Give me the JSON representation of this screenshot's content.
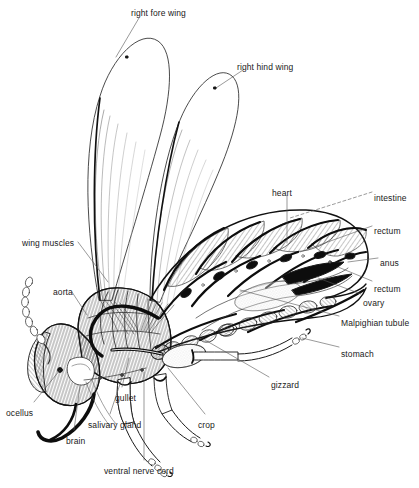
{
  "figure": {
    "type": "scientific line illustration",
    "width": 419,
    "height": 488,
    "background_color": "#ffffff",
    "ink_color": "#1a1a1a"
  },
  "labels": [
    {
      "id": "right-fore-wing",
      "text": "right fore wing",
      "x": 131,
      "y": 8,
      "anchor": "start"
    },
    {
      "id": "right-hind-wing",
      "text": "right hind wing",
      "x": 237,
      "y": 62,
      "anchor": "start"
    },
    {
      "id": "heart",
      "text": "heart",
      "x": 272,
      "y": 188,
      "anchor": "start"
    },
    {
      "id": "intestine",
      "text": "intestine",
      "x": 374,
      "y": 193,
      "anchor": "start"
    },
    {
      "id": "rectum-upper",
      "text": "rectum",
      "x": 374,
      "y": 226,
      "anchor": "start"
    },
    {
      "id": "anus",
      "text": "anus",
      "x": 380,
      "y": 258,
      "anchor": "start"
    },
    {
      "id": "rectum-lower",
      "text": "rectum",
      "x": 374,
      "y": 284,
      "anchor": "start"
    },
    {
      "id": "ovary",
      "text": "ovary",
      "x": 363,
      "y": 298,
      "anchor": "start"
    },
    {
      "id": "malpighian-tubule",
      "text": "Malpighian tubule",
      "x": 341,
      "y": 318,
      "anchor": "start"
    },
    {
      "id": "stomach",
      "text": "stomach",
      "x": 341,
      "y": 349,
      "anchor": "start"
    },
    {
      "id": "gizzard",
      "text": "gizzard",
      "x": 271,
      "y": 380,
      "anchor": "start"
    },
    {
      "id": "crop",
      "text": "crop",
      "x": 198,
      "y": 420,
      "anchor": "start"
    },
    {
      "id": "wing-muscles",
      "text": "wing muscles",
      "x": 22,
      "y": 238,
      "anchor": "start"
    },
    {
      "id": "aorta",
      "text": "aorta",
      "x": 53,
      "y": 287,
      "anchor": "start"
    },
    {
      "id": "ocellus",
      "text": "ocellus",
      "x": 6,
      "y": 408,
      "anchor": "start"
    },
    {
      "id": "brain",
      "text": "brain",
      "x": 66,
      "y": 436,
      "anchor": "start"
    },
    {
      "id": "salivary-gland",
      "text": "salivary gland",
      "x": 88,
      "y": 420,
      "anchor": "start"
    },
    {
      "id": "gullet",
      "text": "gullet",
      "x": 115,
      "y": 393,
      "anchor": "start"
    },
    {
      "id": "ventral-nerve-cord",
      "text": "ventral nerve cord",
      "x": 104,
      "y": 466,
      "anchor": "start"
    }
  ],
  "leader_lines": [
    {
      "id": "leader-right-fore-wing",
      "from": [
        139,
        18
      ],
      "to": [
        116,
        57
      ]
    },
    {
      "id": "leader-right-hind-wing",
      "from": [
        243,
        70
      ],
      "to": [
        216,
        88
      ]
    },
    {
      "id": "leader-heart",
      "from": [
        287,
        196
      ],
      "to": [
        287,
        243
      ]
    },
    {
      "id": "leader-intestine",
      "from": [
        372,
        192
      ],
      "to": [
        290,
        218
      ],
      "dashed": true
    },
    {
      "id": "leader-rectum-upper",
      "from": [
        372,
        226
      ],
      "to": [
        300,
        252
      ]
    },
    {
      "id": "leader-anus",
      "from": [
        378,
        258
      ],
      "to": [
        348,
        262
      ]
    },
    {
      "id": "leader-rectum-lower",
      "from": [
        372,
        281
      ],
      "to": [
        338,
        267
      ]
    },
    {
      "id": "leader-ovary",
      "from": [
        361,
        294
      ],
      "to": [
        318,
        278
      ]
    },
    {
      "id": "leader-malpighian-tubule",
      "from": [
        339,
        316
      ],
      "to": [
        240,
        290
      ]
    },
    {
      "id": "leader-stomach",
      "from": [
        339,
        347
      ],
      "to": [
        302,
        338
      ]
    },
    {
      "id": "leader-gizzard",
      "from": [
        269,
        377
      ],
      "to": [
        205,
        340
      ]
    },
    {
      "id": "leader-crop",
      "from": [
        205,
        414
      ],
      "to": [
        168,
        368
      ]
    },
    {
      "id": "leader-wing-muscles",
      "from": [
        78,
        242
      ],
      "to": [
        108,
        282
      ]
    },
    {
      "id": "leader-aorta",
      "from": [
        72,
        292
      ],
      "to": [
        87,
        315
      ]
    },
    {
      "id": "leader-ocellus",
      "from": [
        34,
        402
      ],
      "to": [
        60,
        370
      ]
    },
    {
      "id": "leader-brain",
      "from": [
        74,
        430
      ],
      "to": [
        80,
        386
      ]
    },
    {
      "id": "leader-salivary-gland",
      "from": [
        110,
        414
      ],
      "to": [
        122,
        378
      ]
    },
    {
      "id": "leader-gullet",
      "from": [
        122,
        387
      ],
      "to": [
        129,
        358
      ]
    },
    {
      "id": "leader-ventral-nerve-cord",
      "from": [
        144,
        460
      ],
      "to": [
        144,
        372
      ]
    }
  ],
  "anatomy_parts": [
    "right fore wing",
    "right hind wing",
    "heart",
    "intestine",
    "rectum",
    "anus",
    "ovary",
    "Malpighian tubule",
    "stomach",
    "gizzard",
    "crop",
    "wing muscles",
    "aorta",
    "ocellus",
    "brain",
    "salivary gland",
    "gullet",
    "ventral nerve cord",
    "antenna",
    "legs",
    "abdomen segments"
  ]
}
